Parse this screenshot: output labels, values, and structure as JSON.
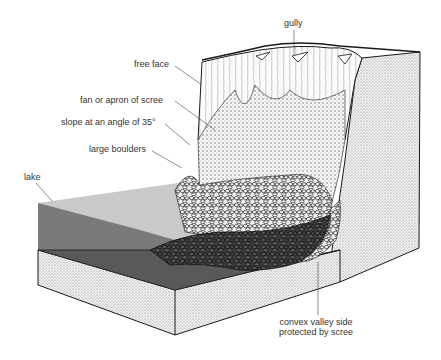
{
  "diagram": {
    "labels": {
      "gully": "gully",
      "free_face": "free face",
      "fan": "fan or apron of scree",
      "slope": "slope at an angle of 35°",
      "boulders": "large boulders",
      "lake": "lake",
      "convex_line1": "convex valley side",
      "convex_line2": "protected by scree"
    },
    "colors": {
      "background": "#ffffff",
      "outline": "#1a1a1a",
      "stipple": "#c8c8c8",
      "lake_surface": "#c9c9c9",
      "lake_side": "#7a7a7a",
      "lake_bed": "#595959",
      "boulders_dark": "#2a2a2a",
      "label_text": "#333333"
    }
  }
}
